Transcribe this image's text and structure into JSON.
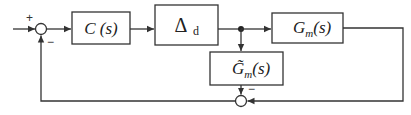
{
  "diagram": {
    "type": "block-diagram",
    "blocks": [
      {
        "id": "controller",
        "label": "C (s)"
      },
      {
        "id": "delay",
        "label_main": "Δ",
        "label_sub": "d"
      },
      {
        "id": "plant-model",
        "label_main": "G",
        "label_sub": "m",
        "label_args": "(s)"
      },
      {
        "id": "model-approx",
        "label_main": "G̃",
        "label_sub": "m",
        "label_args": "(s)"
      }
    ],
    "junctions": [
      {
        "id": "sum-input",
        "signs": {
          "top": "+",
          "bottom": "−"
        }
      },
      {
        "id": "sum-feedback",
        "signs": {
          "top": "−"
        }
      }
    ],
    "connections": [
      {
        "from": "input",
        "to": "sum-input"
      },
      {
        "from": "sum-input",
        "to": "controller"
      },
      {
        "from": "controller",
        "to": "delay"
      },
      {
        "from": "delay",
        "to": "branch-point"
      },
      {
        "from": "branch-point",
        "to": "plant-model"
      },
      {
        "from": "branch-point",
        "to": "model-approx"
      },
      {
        "from": "model-approx",
        "to": "sum-feedback"
      },
      {
        "from": "plant-model",
        "to": "sum-feedback"
      },
      {
        "from": "sum-feedback",
        "to": "sum-input"
      }
    ],
    "colors": {
      "stroke": "#333333",
      "background": "#ffffff"
    }
  }
}
